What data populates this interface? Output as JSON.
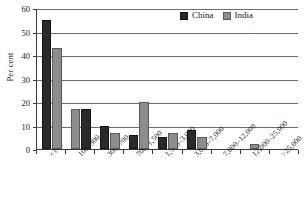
{
  "chart_data": {
    "type": "bar",
    "title": "",
    "xlabel": "",
    "ylabel": "Per cent",
    "ylim": [
      0,
      60
    ],
    "yticks": [
      0,
      10,
      20,
      30,
      40,
      50,
      60
    ],
    "grid": true,
    "legend_position": "top-right",
    "categories": [
      "<100",
      "100–300",
      "300–700",
      "700–1,500",
      "1,500–3,000",
      "3,000–7,000",
      "7,000–12,000",
      "12,000–25,000",
      ">25,000"
    ],
    "series": [
      {
        "name": "China",
        "color": "#2a2a2a",
        "values": [
          55,
          17,
          10,
          6,
          5,
          8,
          0,
          0,
          0
        ]
      },
      {
        "name": "India",
        "color": "#8d8d8d",
        "values": [
          43,
          17,
          7,
          20,
          7,
          5,
          0,
          2,
          0
        ]
      }
    ],
    "series_order_by_group": [
      [
        "China",
        "India"
      ],
      [
        "India",
        "China"
      ],
      [
        "China",
        "India"
      ],
      [
        "China",
        "India"
      ],
      [
        "China",
        "India"
      ],
      [
        "China",
        "India"
      ],
      [
        "China",
        "India"
      ],
      [
        "China",
        "India"
      ],
      [
        "China",
        "India"
      ]
    ]
  },
  "legend": {
    "items": [
      {
        "label": "China",
        "swatch": "china-swatch"
      },
      {
        "label": "India",
        "swatch": "india-swatch"
      }
    ]
  }
}
